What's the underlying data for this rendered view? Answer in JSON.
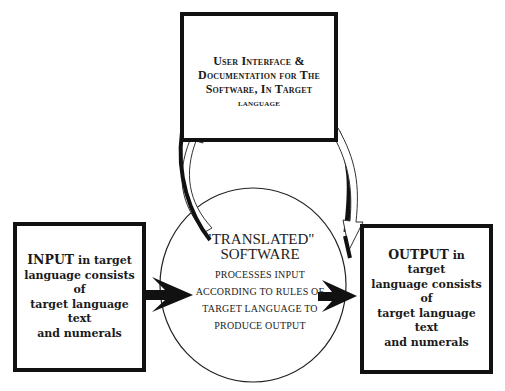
{
  "diagram": {
    "top_box": {
      "lines": [
        "User Interface &",
        "Documentation for The",
        "Software, In Target",
        "language"
      ]
    },
    "input_box": {
      "lead": "INPUT",
      "lines": [
        " in target",
        "language consists of",
        "target language text",
        "and numerals"
      ]
    },
    "center_circle": {
      "title_lines": [
        "\"TRANSLATED\"",
        "SOFTWARE"
      ],
      "body_lines": [
        "PROCESSES INPUT",
        "ACCORDING TO RULES OF",
        "TARGET LANGUAGE TO",
        "PRODUCE OUTPUT"
      ]
    },
    "output_box": {
      "lead": "OUTPUT",
      "lines": [
        " in target",
        "language consists of",
        "target language text",
        "and numerals"
      ]
    },
    "arrows": [
      {
        "from": "input_box",
        "to": "center_circle",
        "style": "solid-black"
      },
      {
        "from": "center_circle",
        "to": "output_box",
        "style": "solid-black"
      },
      {
        "from": "center_circle",
        "to": "top_box",
        "style": "hollow-curved"
      },
      {
        "from": "top_box",
        "to": "center_circle",
        "style": "hollow-curved-shadowed"
      }
    ],
    "colors": {
      "stroke": "#111111",
      "background": "#ffffff"
    }
  }
}
